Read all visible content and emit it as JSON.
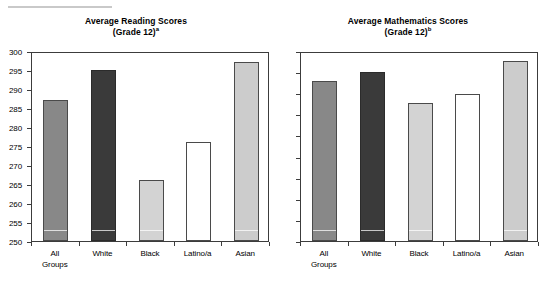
{
  "chart_data": [
    {
      "type": "bar",
      "title": "Average Reading Scores",
      "subtitle": "(Grade 12)",
      "subtitle_superscript": "a",
      "categories": [
        "All Groups",
        "White",
        "Black",
        "Latino/a",
        "Asian"
      ],
      "category_lines": [
        [
          "All",
          "Groups"
        ],
        [
          "White"
        ],
        [
          "Black"
        ],
        [
          "Latino/a"
        ],
        [
          "Asian"
        ]
      ],
      "values": [
        287,
        295,
        266,
        276,
        297
      ],
      "series": [
        {
          "name": "Average Reading Score (Grade 12)",
          "values": [
            287,
            295,
            266,
            276,
            297
          ]
        }
      ],
      "xlabel": "",
      "ylabel": "",
      "ylim": [
        250,
        300
      ],
      "yticks": [
        250,
        255,
        260,
        265,
        270,
        275,
        280,
        285,
        290,
        295,
        300
      ],
      "ytick_labels": [
        "250",
        "255",
        "260",
        "265",
        "270",
        "275",
        "280",
        "285",
        "290",
        "295",
        "300"
      ],
      "grid": false,
      "legend": "none",
      "bar_colors": [
        "#888888",
        "#3a3a3a",
        "#d3d3d3",
        "#ffffff",
        "#cccccc"
      ]
    },
    {
      "type": "bar",
      "title": "Average Mathematics Scores",
      "subtitle": "(Grade 12)",
      "subtitle_superscript": "b",
      "categories": [
        "All Groups",
        "White",
        "Black",
        "Latino/a",
        "Asian"
      ],
      "category_lines": [
        [
          "All",
          "Groups"
        ],
        [
          "White"
        ],
        [
          "Black"
        ],
        [
          "Latino/a"
        ],
        [
          "Asian"
        ]
      ],
      "values": [
        152,
        160,
        131,
        139,
        171
      ],
      "series": [
        {
          "name": "Average Mathematics Score (Grade 12)",
          "values": [
            152,
            160,
            131,
            139,
            171
          ]
        }
      ],
      "xlabel": "",
      "ylabel": "",
      "ylim": [
        0,
        180
      ],
      "yticks": [
        0,
        20,
        40,
        60,
        80,
        100,
        120,
        140,
        160,
        180
      ],
      "ytick_labels": [
        "0",
        "20",
        "40",
        "60",
        "80",
        "100",
        "120",
        "140",
        "160",
        "180"
      ],
      "grid": false,
      "legend": "none",
      "bar_colors": [
        "#888888",
        "#3a3a3a",
        "#d3d3d3",
        "#ffffff",
        "#cccccc"
      ]
    }
  ],
  "figure": {
    "panel_titles": {
      "left_line1": "Average Reading Scores",
      "left_line2": "(Grade 12)",
      "left_superscript": "a",
      "right_line1": "Average Mathematics Scores",
      "right_line2": "(Grade 12)",
      "right_superscript": "b"
    },
    "colors": {
      "axis": "#3c3c3c",
      "background": "#ffffff",
      "all_groups": "#888888",
      "white": "#3a3a3a",
      "black": "#d3d3d3",
      "latino": "#ffffff",
      "asian": "#cccccc"
    }
  }
}
